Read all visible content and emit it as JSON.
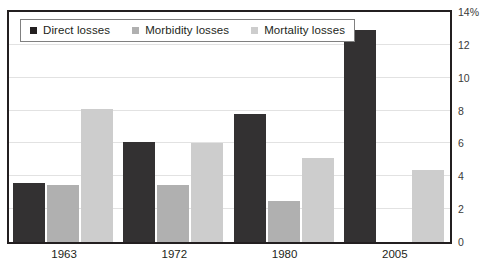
{
  "chart_data": {
    "type": "bar",
    "title": "",
    "subtitle": "",
    "xlabel": "",
    "ylabel": "",
    "categories": [
      "1963",
      "1972",
      "1980",
      "2005"
    ],
    "series": [
      {
        "name": "Direct losses",
        "color": "#333132",
        "values": [
          3.6,
          6.1,
          7.8,
          12.9
        ]
      },
      {
        "name": "Morbidity losses",
        "color": "#b0b0b0",
        "values": [
          3.5,
          3.5,
          2.5,
          null
        ]
      },
      {
        "name": "Mortality losses",
        "color": "#cdcdcd",
        "values": [
          8.1,
          6.0,
          5.1,
          4.4
        ]
      }
    ],
    "ylim": [
      0,
      14
    ],
    "ytick_values": [
      0,
      2,
      4,
      6,
      8,
      10,
      12,
      14
    ],
    "ytick_labels": [
      "0",
      "2",
      "4",
      "6",
      "8",
      "10",
      "12",
      "14%"
    ],
    "y_axis_position": "right",
    "grid": true,
    "legend_position": "top-left"
  },
  "legend": {
    "items": [
      {
        "label": "Direct losses",
        "swatch": "legend-swatch-direct"
      },
      {
        "label": "Morbidity losses",
        "swatch": "legend-swatch-morbidity"
      },
      {
        "label": "Mortality losses",
        "swatch": "legend-swatch-mortality"
      }
    ]
  }
}
